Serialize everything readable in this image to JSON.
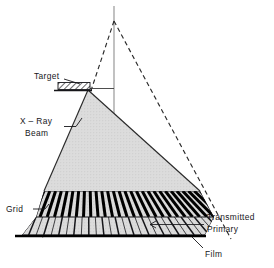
{
  "figure": {
    "type": "technical-line-diagram",
    "background_color": "#ffffff",
    "ink_color": "#16161a",
    "beam_fill_color": "#d9d9d9",
    "beam_stroke_color": "#2a2a2a",
    "grid_strip_color": "#000000",
    "dashed_line_color": "#2a2a2a",
    "center_line_color": "#8a8a8a",
    "film_line_color": "#000000"
  },
  "labels": {
    "target": "Target",
    "xray_beam_line1": "X – Ray",
    "xray_beam_line2": "Beam",
    "grid": "Grid",
    "transmitted": "Transmitted",
    "primary": "Primary",
    "film": "Film"
  },
  "chart_data": {
    "type": "diagram",
    "annotations": [
      {
        "name": "target",
        "text": "Target",
        "x": 40,
        "y": 76,
        "leader_to_x": 86,
        "leader_to_y": 88
      },
      {
        "name": "x-ray-beam",
        "text": "X – Ray Beam",
        "x": 22,
        "y": 126,
        "leader_to_x": 72,
        "leader_to_y": 128
      },
      {
        "name": "grid",
        "text": "Grid",
        "x": 8,
        "y": 210,
        "leader_to_x": 38,
        "leader_to_y": 208
      },
      {
        "name": "transmitted-primary",
        "text": "Transmitted Primary",
        "x": 206,
        "y": 220,
        "leader_to_x": 166,
        "leader_to_y": 228
      },
      {
        "name": "film",
        "text": "Film",
        "x": 206,
        "y": 256,
        "leader_to_x": 193,
        "leader_to_y": 236
      }
    ],
    "elements": [
      {
        "name": "dashed-triangle",
        "apex_x": 114,
        "apex_y": 21,
        "left_base_x": 42,
        "left_base_y": 238,
        "right_base_x": 230,
        "right_base_y": 238,
        "style": "dashed"
      },
      {
        "name": "center-line",
        "x": 114,
        "y_top": 6,
        "y_bottom": 236,
        "style": "solid-gray"
      },
      {
        "name": "horizontal-reference-line",
        "x_start": 88,
        "x_end": 114,
        "y": 88
      },
      {
        "name": "target-block",
        "x": 58,
        "y": 82,
        "width": 32,
        "height": 7,
        "hatch": "diagonal"
      },
      {
        "name": "xray-beam-triangle",
        "apex_x": 88,
        "apex_y": 90,
        "left_base_x": 44,
        "left_base_y": 191,
        "right_base_x": 200,
        "right_base_y": 191,
        "fill": "#d9d9d9"
      },
      {
        "name": "grid-band",
        "y_top": 191,
        "y_bottom": 217,
        "x_left_top": 44,
        "x_right_top": 200,
        "x_left_bottom": 36,
        "x_right_bottom": 214,
        "slat_count": 27
      },
      {
        "name": "transmitted-band",
        "y_top": 217,
        "y_bottom": 235,
        "x_left_top": 36,
        "x_right_top": 214,
        "x_left_bottom": 22,
        "x_right_bottom": 205,
        "ray_count": 27
      },
      {
        "name": "film-line",
        "x_start": 15,
        "x_end": 206,
        "y": 236,
        "thickness": 2.4
      }
    ],
    "focal_point": {
      "x": 88,
      "y": 90,
      "description": "grid slats converge toward the target focal spot"
    }
  }
}
